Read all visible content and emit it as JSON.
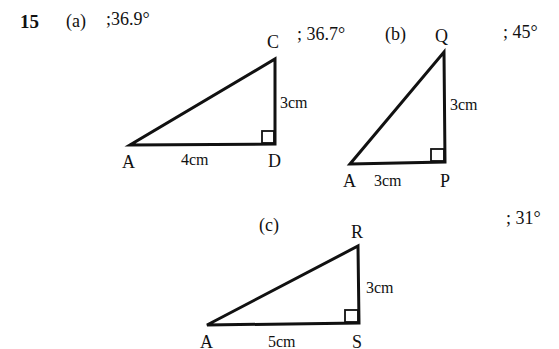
{
  "question": {
    "number": "15",
    "parts": [
      {
        "label": "(a)",
        "answers": [
          ";36.9°",
          "; 36.7°"
        ],
        "triangle": {
          "vertices": {
            "A": "A",
            "D": "D",
            "C": "C"
          },
          "base": "4cm",
          "height": "3cm",
          "right_angle_at": "D"
        }
      },
      {
        "label": "(b)",
        "answers": [
          "; 45°"
        ],
        "triangle": {
          "vertices": {
            "A": "A",
            "P": "P",
            "Q": "Q"
          },
          "base": "3cm",
          "height": "3cm",
          "right_angle_at": "P"
        }
      },
      {
        "label": "(c)",
        "answers": [
          "; 31°"
        ],
        "triangle": {
          "vertices": {
            "A": "A",
            "S": "S",
            "R": "R"
          },
          "base": "5cm",
          "height": "3cm",
          "right_angle_at": "S"
        }
      }
    ]
  },
  "colors": {
    "ink": "#111111",
    "background": "#ffffff"
  }
}
